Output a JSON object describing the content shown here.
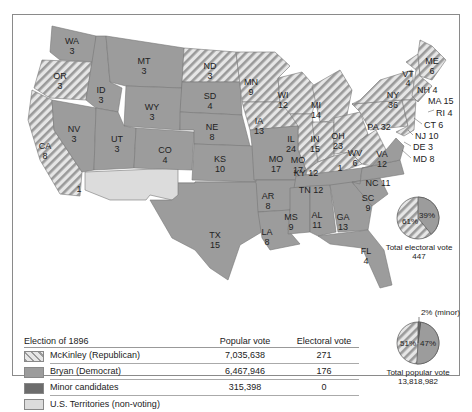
{
  "legend": {
    "title": "Election of 1896",
    "col_popular": "Popular vote",
    "col_electoral": "Electoral vote",
    "rows": [
      {
        "name": "McKinley (Republican)",
        "popular": "7,035,638",
        "electoral": "271",
        "swatch": "hatched"
      },
      {
        "name": "Bryan (Democrat)",
        "popular": "6,467,946",
        "electoral": "176",
        "swatch": "#9c9c9c"
      },
      {
        "name": "Minor candidates",
        "popular": "315,398",
        "electoral": "0",
        "swatch": "#6c6c6c"
      },
      {
        "name": "U.S. Territories (non-voting)",
        "popular": "",
        "electoral": "",
        "swatch": "#dcdcdc"
      }
    ]
  },
  "electoral_pie": {
    "mckinley_pct": "61%",
    "bryan_pct": "39%",
    "caption": "Total electoral vote",
    "total": "447"
  },
  "popular_pie": {
    "mckinley_pct": "51%",
    "bryan_pct": "47%",
    "minor_pct": "2% (minor)",
    "caption": "Total popular vote",
    "total": "13,818,982"
  },
  "states": {
    "WA": "WA",
    "WA_v": "3",
    "OR": "OR",
    "OR_v": "3",
    "CA": "CA",
    "CA_v": "8",
    "CA_split": "1",
    "ID": "ID",
    "ID_v": "3",
    "NV": "NV",
    "NV_v": "3",
    "MT": "MT",
    "MT_v": "3",
    "WY": "WY",
    "WY_v": "3",
    "UT": "UT",
    "UT_v": "3",
    "CO": "CO",
    "CO_v": "4",
    "ND": "ND",
    "ND_v": "3",
    "SD": "SD",
    "SD_v": "4",
    "NE": "NE",
    "NE_v": "8",
    "KS": "KS",
    "KS_v": "10",
    "TX": "TX",
    "TX_v": "15",
    "MN": "MN",
    "MN_v": "9",
    "IA": "IA",
    "IA_v": "13",
    "MO": "MO",
    "MO_v": "17",
    "AR": "AR",
    "AR_v": "8",
    "LA": "LA",
    "LA_v": "8",
    "WI": "WI",
    "WI_v": "12",
    "IL": "IL",
    "IL_v": "24",
    "MI": "MI",
    "MI_v": "14",
    "IN": "IN",
    "IN_v": "15",
    "OH": "OH",
    "OH_v": "23",
    "KY": "KY 12",
    "KY_split": "1",
    "TN": "TN 12",
    "MS": "MS",
    "MS_v": "9",
    "AL": "AL",
    "AL_v": "11",
    "GA": "GA",
    "GA_v": "13",
    "FL": "FL",
    "FL_v": "4",
    "SC": "SC",
    "SC_v": "9",
    "NC": "NC 11",
    "VA": "VA",
    "VA_v": "12",
    "WV": "WV",
    "WV_v": "6",
    "PA": "PA 32",
    "NY": "NY",
    "NY_v": "36",
    "VT": "VT",
    "VT_v": "4",
    "ME": "ME",
    "ME_v": "6",
    "NH": "NH 4",
    "MA": "MA 15",
    "RI": "RI 4",
    "CT": "CT 6",
    "NJ": "NJ 10",
    "DE": "DE 3",
    "MD": "MD 8"
  },
  "colors": {
    "mckinley_hatch_dark": "#9a9a9a",
    "mckinley_hatch_light": "#e6e6e6",
    "bryan": "#9c9c9c",
    "minor": "#6c6c6c",
    "territory": "#dcdcdc",
    "border": "#777777"
  }
}
